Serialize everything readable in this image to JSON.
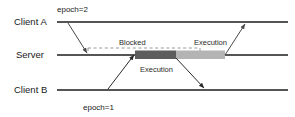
{
  "diagram": {
    "colors": {
      "lane_line": "#1c1c1c",
      "arrow": "#4a4a4a",
      "arrow_dark": "#2a2a2a",
      "blocked_dash": "#8c8c8c",
      "execution_bar_dark": "#5d5d5d",
      "execution_bar_light": "#b4b4b4",
      "text": "#1a1a1a",
      "background": "#ffffff"
    },
    "lanes": [
      {
        "id": "client-a",
        "label": "Client A",
        "y": 22
      },
      {
        "id": "server",
        "label": "Server",
        "y": 55
      },
      {
        "id": "client-b",
        "label": "Client B",
        "y": 90
      }
    ],
    "annotations": {
      "blocked": "Blocked",
      "execution_server_right": "Execution",
      "execution_below_server": "Execution"
    },
    "epochs": [
      {
        "id": "epoch-2",
        "label": "epoch=2",
        "lane": "client-a"
      },
      {
        "id": "epoch-1",
        "label": "epoch=1",
        "lane": "client-b"
      }
    ],
    "messages": [
      {
        "id": "request-client-a-to-server",
        "from": "client-a",
        "to": "server"
      },
      {
        "id": "request-client-b-to-server",
        "from": "client-b",
        "to": "server"
      },
      {
        "id": "reply-server-to-client-b",
        "from": "server",
        "to": "client-b"
      },
      {
        "id": "reply-server-to-client-a",
        "from": "server",
        "to": "client-a"
      }
    ],
    "execution_bars": [
      {
        "id": "execution-bar-first",
        "shade": "dark"
      },
      {
        "id": "execution-bar-second",
        "shade": "light"
      }
    ]
  }
}
